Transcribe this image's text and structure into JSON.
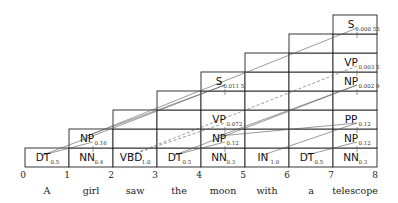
{
  "grid": {
    "x0": 25,
    "col_width": 44,
    "bottom_y": 167,
    "row_height": 19
  },
  "colors": {
    "grid": "#222222",
    "backpointer": "#555555",
    "text": "#111111"
  },
  "words": [
    "A",
    "girl",
    "saw",
    "the",
    "moon",
    "with",
    "a",
    "telescope"
  ],
  "ticks": [
    "0",
    "1",
    "2",
    "3",
    "4",
    "5",
    "6",
    "7",
    "8"
  ],
  "columns": [
    {
      "height": 1,
      "cells": [
        {
          "row": 0,
          "label": "DT",
          "prob": "0.5"
        }
      ]
    },
    {
      "height": 2,
      "cells": [
        {
          "row": 0,
          "label": "NN",
          "prob": "0.4"
        },
        {
          "row": 1,
          "label": "NP",
          "prob": "0.16"
        }
      ]
    },
    {
      "height": 3,
      "cells": [
        {
          "row": 0,
          "label": "VBD",
          "prob": "1.0"
        }
      ]
    },
    {
      "height": 4,
      "cells": [
        {
          "row": 0,
          "label": "DT",
          "prob": "0.5"
        }
      ]
    },
    {
      "height": 5,
      "cells": [
        {
          "row": 0,
          "label": "NN",
          "prob": "0.3"
        },
        {
          "row": 1,
          "label": "NP",
          "prob": "0.12"
        },
        {
          "row": 2,
          "label": "VP",
          "prob": "0.072"
        },
        {
          "row": 4,
          "label": "S",
          "prob": "0.011 5"
        }
      ]
    },
    {
      "height": 6,
      "cells": [
        {
          "row": 0,
          "label": "IN",
          "prob": "1.0"
        }
      ]
    },
    {
      "height": 7,
      "cells": [
        {
          "row": 0,
          "label": "DT",
          "prob": "0.5"
        }
      ]
    },
    {
      "height": 8,
      "cells": [
        {
          "row": 0,
          "label": "NN",
          "prob": "0.3"
        },
        {
          "row": 1,
          "label": "NP",
          "prob": "0.12"
        },
        {
          "row": 2,
          "label": "PP",
          "prob": "0.12"
        },
        {
          "row": 4,
          "label": "NP",
          "prob": "0.002 9"
        },
        {
          "row": 5,
          "label": "VP",
          "prob": "0.003 5"
        },
        {
          "row": 7,
          "label": "S",
          "prob": "0.000 55"
        }
      ]
    }
  ],
  "backpointers": [
    {
      "from": [
        0,
        0
      ],
      "to": [
        1,
        1
      ],
      "style": "solid"
    },
    {
      "from": [
        1,
        1
      ],
      "to": [
        4,
        4
      ],
      "style": "solid"
    },
    {
      "from": [
        0,
        0
      ],
      "to": [
        4,
        4
      ],
      "style": "solid"
    },
    {
      "from": [
        2,
        0
      ],
      "to": [
        4,
        2
      ],
      "style": "dashed"
    },
    {
      "from": [
        2,
        0
      ],
      "to": [
        7,
        5
      ],
      "style": "dashed"
    },
    {
      "from": [
        3,
        0
      ],
      "to": [
        4,
        1
      ],
      "style": "solid"
    },
    {
      "from": [
        4,
        1
      ],
      "to": [
        7,
        4
      ],
      "style": "solid"
    },
    {
      "from": [
        5,
        0
      ],
      "to": [
        7,
        2
      ],
      "style": "solid"
    },
    {
      "from": [
        6,
        0
      ],
      "to": [
        7,
        1
      ],
      "style": "solid"
    },
    {
      "from": [
        1,
        1
      ],
      "to": [
        7,
        7
      ],
      "style": "solid"
    },
    {
      "from": [
        3,
        0
      ],
      "to": [
        7,
        4
      ],
      "style": "solid"
    },
    {
      "from": [
        4,
        1
      ],
      "to": [
        7,
        2
      ],
      "style": "solid"
    }
  ]
}
